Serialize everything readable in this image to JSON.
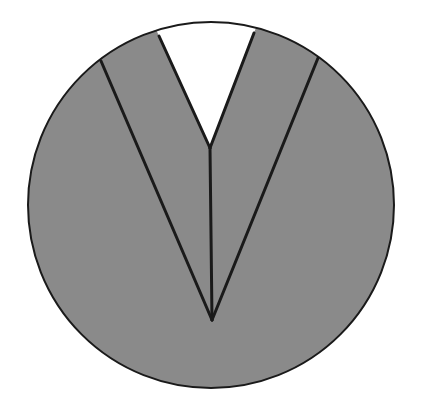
{
  "diagram": {
    "colors": {
      "background": "#ffffff",
      "fill": "#8a8a8a",
      "notch": "#ffffff",
      "stroke": "#1a1a1a"
    },
    "circle": {
      "cx": 211,
      "cy": 205,
      "r": 183
    },
    "inner_apex": {
      "x": 210,
      "y": 148
    },
    "bottom_apex": {
      "x": 212,
      "y": 320
    },
    "inner_left_end": {
      "x": 159,
      "y": 36
    },
    "inner_right_end": {
      "x": 254,
      "y": 33
    },
    "outer_left_end": {
      "x": 101,
      "y": 61
    },
    "outer_right_end": {
      "x": 318,
      "y": 58
    }
  }
}
